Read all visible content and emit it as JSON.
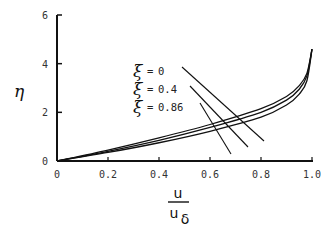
{
  "chart_data": {
    "type": "line",
    "title": "",
    "xlabel": "u / u_δ",
    "xlabel_numerator": "u",
    "xlabel_denominator": "u",
    "xlabel_subscript": "δ",
    "ylabel": "η",
    "xlim": [
      0,
      1.0
    ],
    "ylim": [
      0,
      6
    ],
    "x_ticks": [
      "0",
      "0.2",
      "0.4",
      "0.6",
      "0.8",
      "1.0"
    ],
    "y_ticks": [
      "0",
      "2",
      "4",
      "6"
    ],
    "grid": false,
    "legend_position": "inline annotations with leader lines",
    "series": [
      {
        "name": "ξ = 0",
        "symbol": "ξ",
        "eq": "=",
        "value": "0",
        "x": [
          0,
          0.2,
          0.4,
          0.6,
          0.8,
          0.9,
          0.95,
          0.98,
          1.0
        ],
        "y": [
          0,
          0.45,
          0.95,
          1.5,
          2.15,
          2.65,
          3.1,
          3.6,
          4.6
        ]
      },
      {
        "name": "ξ = 0.4",
        "symbol": "ξ",
        "eq": "=",
        "value": "0.4",
        "x": [
          0,
          0.2,
          0.4,
          0.6,
          0.8,
          0.9,
          0.95,
          0.98,
          1.0
        ],
        "y": [
          0,
          0.4,
          0.85,
          1.38,
          2.0,
          2.5,
          2.95,
          3.5,
          4.6
        ]
      },
      {
        "name": "ξ = 0.86",
        "symbol": "ξ",
        "eq": "=",
        "value": "0.86",
        "x": [
          0,
          0.2,
          0.4,
          0.6,
          0.8,
          0.9,
          0.95,
          0.98,
          1.0
        ],
        "y": [
          0,
          0.35,
          0.75,
          1.22,
          1.8,
          2.3,
          2.75,
          3.3,
          4.6
        ]
      }
    ]
  }
}
